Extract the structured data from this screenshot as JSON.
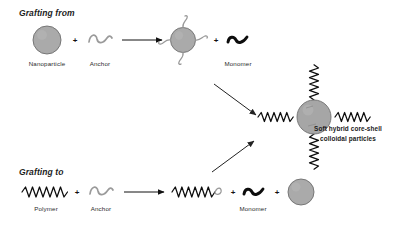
{
  "figure": {
    "background_color": "#ffffff",
    "width": 420,
    "height": 232
  },
  "routes": {
    "grafting_from": {
      "title": "Grafting from",
      "labels": {
        "nanoparticle": "Nanoparticle",
        "anchor": "Anchor",
        "monomer": "Monomer"
      },
      "plus_symbol": "+"
    },
    "grafting_to": {
      "title": "Grafting to",
      "labels": {
        "polymer": "Polymer",
        "anchor": "Anchor",
        "monomer": "Monomer"
      },
      "plus_symbol": "+"
    }
  },
  "product": {
    "label_line1": "Soft hybrid core-shell",
    "label_line2": "colloidal particles"
  },
  "colors": {
    "nanoparticle_fill": "#aaaaaa",
    "nanoparticle_stroke": "#6e6e6e",
    "anchor": "#9a9a9a",
    "monomer": "#0d0d0d",
    "polymer": "#0d0d0d",
    "arrow": "#111111",
    "text": "#1a1a1a"
  },
  "icons": {
    "nanoparticle": "gray-circle-icon",
    "anchor": "gray-squiggle-icon",
    "monomer": "black-thick-squiggle-icon",
    "polymer": "black-zigzag-icon",
    "arrow_right": "right-arrow-icon",
    "arrow_diagonal_down": "diagonal-down-right-arrow-icon",
    "arrow_diagonal_up": "diagonal-up-right-arrow-icon",
    "core_shell_particle": "core-shell-particle-icon"
  }
}
